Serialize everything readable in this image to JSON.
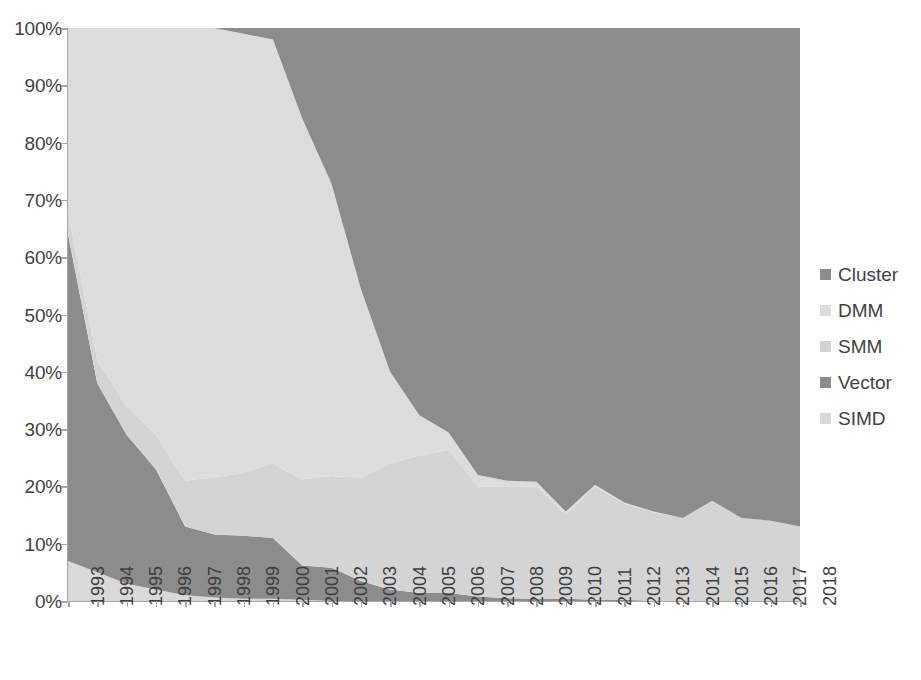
{
  "chart": {
    "type": "area",
    "title": "",
    "subtitle": "",
    "xlabel": "",
    "ylabel": "",
    "stacked": true,
    "stack_mode": "percent",
    "grid": false,
    "legend_position": "right",
    "ylim": [
      0,
      100
    ],
    "y_tick_labels": [
      "100%",
      "90%",
      "80%",
      "70%",
      "60%",
      "50%",
      "40%",
      "30%",
      "20%",
      "10%",
      "0%"
    ],
    "y_tick_values": [
      100,
      90,
      80,
      70,
      60,
      50,
      40,
      30,
      20,
      10,
      0
    ],
    "axis_color": "#a6a6a6",
    "tick_text_color": "#3f3f3f"
  },
  "chart_data": {
    "type": "area",
    "title": "",
    "xlabel": "",
    "ylabel": "",
    "ylim": [
      0,
      100
    ],
    "grid": false,
    "legend_position": "right",
    "stacked_percent": true,
    "categories": [
      "1993",
      "1994",
      "1995",
      "1996",
      "1997",
      "1998",
      "1999",
      "2000",
      "2001",
      "2002",
      "2003",
      "2004",
      "2005",
      "2006",
      "2007",
      "2008",
      "2009",
      "2010",
      "2011",
      "2012",
      "2013",
      "2014",
      "2015",
      "2016",
      "2017",
      "2018"
    ],
    "series": [
      {
        "name": "SIMD",
        "color": "#d9d9d9",
        "values": [
          7,
          5,
          3,
          2,
          1,
          0.6,
          0.4,
          0.4,
          0.2,
          0,
          0,
          0,
          0,
          0,
          0,
          0,
          0,
          0,
          0,
          0,
          0,
          0,
          0,
          0,
          0,
          0
        ]
      },
      {
        "name": "Vector",
        "color": "#8c8c8c",
        "values": [
          57,
          33,
          26,
          21,
          12,
          11,
          11,
          10.6,
          6,
          5.8,
          3.5,
          2,
          1.4,
          1.4,
          0.8,
          0.5,
          0.4,
          0.4,
          0.2,
          0.2,
          0,
          0,
          0,
          0,
          0,
          0
        ]
      },
      {
        "name": "SMM",
        "color": "#d4d4d4",
        "values": [
          4,
          4,
          5,
          6,
          8,
          10,
          11,
          13,
          15,
          16,
          18,
          22,
          24,
          25,
          19.2,
          19.5,
          19.6,
          14.6,
          19.8,
          16.8,
          15.5,
          14.5,
          17.5,
          14.5,
          14,
          13
        ]
      },
      {
        "name": "DMM",
        "color": "#dcdcdc",
        "values": [
          32,
          58,
          66,
          71,
          79,
          78.4,
          76.6,
          74,
          63,
          51,
          33,
          16,
          7,
          3,
          2,
          1,
          0.8,
          0.6,
          0.3,
          0.2,
          0.1,
          0,
          0,
          0,
          0,
          0
        ]
      },
      {
        "name": "Cluster",
        "color": "#8c8c8c",
        "values": [
          0,
          0,
          0,
          0,
          0,
          0,
          1,
          2,
          15.8,
          27.2,
          45.5,
          60,
          67.6,
          70.6,
          78,
          79,
          79.2,
          84.4,
          79.7,
          82.8,
          84.4,
          85.5,
          82.5,
          85.5,
          86,
          87
        ]
      }
    ],
    "boundaries_note": "bands rendered bottom-up: SIMD, Vector, SMM, DMM, Cluster"
  },
  "legend": {
    "items": [
      {
        "label": "Cluster",
        "color": "#8c8c8c"
      },
      {
        "label": "DMM",
        "color": "#dcdcdc"
      },
      {
        "label": "SMM",
        "color": "#d4d4d4"
      },
      {
        "label": "Vector",
        "color": "#8c8c8c"
      },
      {
        "label": "SIMD",
        "color": "#d9d9d9"
      }
    ]
  }
}
